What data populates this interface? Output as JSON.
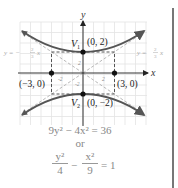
{
  "figure": {
    "axes": {
      "x_label": "x",
      "y_label": "y"
    },
    "tick_labels": {
      "x_neg": "-2",
      "x_pos": "2",
      "y_pos": "2",
      "y_neg": "-2"
    },
    "points": {
      "v1": {
        "name": "V",
        "sub": "1",
        "coords": "(0, 2)"
      },
      "v2": {
        "name": "V",
        "sub": "2",
        "coords": "(0, −2)"
      },
      "left": {
        "coords": "(−3, 0)"
      },
      "right": {
        "coords": "(3, 0)"
      }
    },
    "asymptotes": {
      "left_label_prefix": "y = −",
      "left_num": "2",
      "left_den": "3",
      "left_suffix": "x",
      "right_label_prefix": "y = ",
      "right_num": "2",
      "right_den": "3",
      "right_suffix": "x"
    },
    "colors": {
      "curve": "#555555",
      "asymptote": "#b0b0b0",
      "grid": "#e2e2e2",
      "axis": "#333333",
      "box": "#444444",
      "point": "#111111"
    }
  },
  "equations": {
    "standard": "9y² − 4x² = 36",
    "or": "or",
    "frac1_num": "y²",
    "frac1_den": "4",
    "minus": "−",
    "frac2_num": "x²",
    "frac2_den": "9",
    "rhs": "= 1"
  }
}
